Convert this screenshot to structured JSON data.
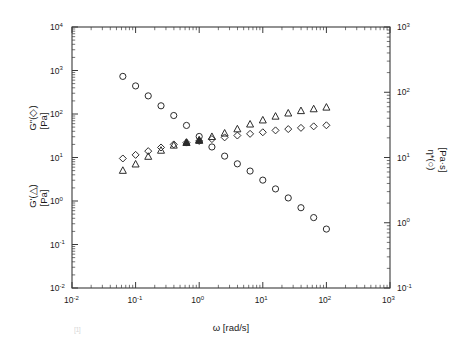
{
  "figure": {
    "background_color": "#ffffff",
    "axis_color": "#3a3a3a",
    "marker_color": "#2b2b2b",
    "caption_artifact": "[1]"
  },
  "axes": {
    "x": {
      "title": "ω [rad/s]",
      "tick_labels": [
        "10",
        "10",
        "10",
        "10",
        "10",
        "10"
      ],
      "tick_exponents": [
        "-2",
        "-1",
        "0",
        "1",
        "2",
        "3"
      ],
      "min_exp": -2,
      "max_exp": 3
    },
    "y_left": {
      "title_upper": "G\"(◇)",
      "title_upper_unit": "[Pa]",
      "title_lower": "G'(△)",
      "title_lower_unit": "[Pa]",
      "tick_labels": [
        "10",
        "10",
        "10",
        "10",
        "10",
        "10",
        "10"
      ],
      "tick_exponents": [
        "-2",
        "-1",
        "0",
        "1",
        "2",
        "3",
        "4"
      ],
      "min_exp": -2,
      "max_exp": 4
    },
    "y_right": {
      "title": "η*(○)",
      "title_unit": "[Pa·s]",
      "tick_labels": [
        "10",
        "10",
        "10",
        "10",
        "10"
      ],
      "tick_exponents": [
        "-1",
        "0",
        "1",
        "2",
        "3"
      ],
      "min_exp": -1,
      "max_exp": 3
    }
  },
  "chart_data": {
    "type": "scatter",
    "title": "",
    "xlabel": "ω [rad/s]",
    "ylabel": "G'(△) [Pa]   G\"(◇) [Pa]",
    "ylabel_right": "η*(○) [Pa·s]",
    "xscale": "log",
    "yscale": "log",
    "xlim": [
      0.01,
      1000
    ],
    "ylim_left": [
      0.01,
      10000
    ],
    "ylim_right": [
      0.1,
      1000
    ],
    "grid": false,
    "legend": "none",
    "series": [
      {
        "name": "η*(○)",
        "marker": "circle",
        "filled": false,
        "axis": "right",
        "x": [
          0.063,
          0.1,
          0.158,
          0.251,
          0.398,
          0.631,
          1.0,
          1.585,
          2.512,
          3.981,
          6.31,
          10.0,
          15.85,
          25.12,
          39.81,
          63.1,
          100.0
        ],
        "y": [
          175.0,
          125.0,
          88.0,
          62.0,
          44.0,
          31.0,
          21.0,
          14.5,
          10.5,
          8.0,
          6.2,
          4.5,
          3.3,
          2.4,
          1.7,
          1.2,
          0.8
        ]
      },
      {
        "name": "G\"(◇)",
        "marker": "diamond",
        "filled": false,
        "axis": "left",
        "x": [
          0.063,
          0.1,
          0.158,
          0.251,
          0.398,
          0.631,
          1.0,
          1.585,
          2.512,
          3.981,
          6.31,
          10.0,
          15.85,
          25.12,
          39.81,
          63.1,
          100.0
        ],
        "y": [
          9.5,
          11.5,
          14.0,
          17.0,
          20.0,
          22.0,
          24.0,
          26.5,
          29.0,
          32.0,
          35.0,
          38.0,
          42.0,
          45.0,
          48.0,
          52.0,
          55.0
        ]
      },
      {
        "name": "G'(△)",
        "marker": "triangle",
        "filled": false,
        "axis": "left",
        "x": [
          0.063,
          0.1,
          0.158,
          0.251,
          0.398,
          0.631,
          1.0,
          1.585,
          2.512,
          3.981,
          6.31,
          10.0,
          15.85,
          25.12,
          39.81,
          63.1,
          100.0
        ],
        "y": [
          5.0,
          7.0,
          10.5,
          14.5,
          19.0,
          22.0,
          25.0,
          30.0,
          36.0,
          45.0,
          58.0,
          72.0,
          88.0,
          104.0,
          118.0,
          130.0,
          142.0
        ]
      }
    ],
    "filled_overlap_points": [
      {
        "x": 0.631,
        "y": 22.0,
        "axis": "left",
        "marker": "triangle"
      },
      {
        "x": 1.0,
        "y": 24.5,
        "axis": "left",
        "marker": "triangle"
      }
    ]
  }
}
